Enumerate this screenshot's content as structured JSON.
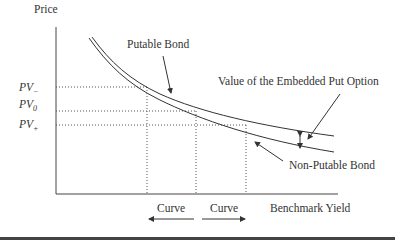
{
  "diagram": {
    "y_axis_label": "Price",
    "x_axis_label": "Benchmark Yield",
    "curves": [
      {
        "name": "Putable Bond",
        "label": "Putable Bond",
        "position": "upper"
      },
      {
        "name": "Non-Putable Bond",
        "label": "Non-Putable Bond",
        "position": "lower"
      }
    ],
    "annotation": "Value of the Embedded Put Option",
    "price_levels": [
      {
        "base": "PV",
        "sub": "−",
        "label": "PV−"
      },
      {
        "base": "PV",
        "sub": "0",
        "label": "PV0"
      },
      {
        "base": "PV",
        "sub": "+",
        "label": "PV+"
      }
    ],
    "yield_shifts": [
      {
        "label": "Curve",
        "direction": "left"
      },
      {
        "label": "Curve",
        "direction": "right"
      }
    ]
  }
}
